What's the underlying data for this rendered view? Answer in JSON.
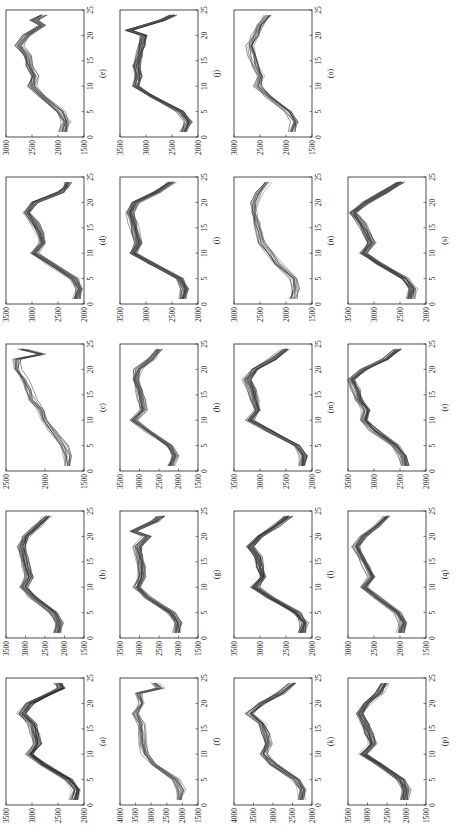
{
  "figure": {
    "layout": {
      "rows": 4,
      "cols": 5,
      "rotation_deg": -90
    },
    "x_ticks": [
      0,
      5,
      10,
      15,
      20,
      25
    ]
  },
  "chart_data": [
    {
      "type": "line",
      "label": "(a)",
      "xlim": [
        0,
        25
      ],
      "ylim": [
        2000,
        3500
      ],
      "yticks": [
        2000,
        2500,
        3000,
        3500
      ],
      "series_count": 25,
      "profile": [
        [
          1,
          2200
        ],
        [
          3,
          2150
        ],
        [
          5,
          2300
        ],
        [
          8,
          2800
        ],
        [
          10,
          3050
        ],
        [
          12,
          2900
        ],
        [
          14,
          2950
        ],
        [
          16,
          3000
        ],
        [
          18,
          3200
        ],
        [
          20,
          3050
        ],
        [
          22,
          2650
        ],
        [
          23,
          2450
        ],
        [
          24,
          2500
        ]
      ]
    },
    {
      "type": "line",
      "label": "(b)",
      "xlim": [
        0,
        25
      ],
      "ylim": [
        1500,
        3500
      ],
      "yticks": [
        1500,
        2000,
        2500,
        3000,
        3500
      ],
      "series_count": 25,
      "profile": [
        [
          1,
          2200
        ],
        [
          3,
          2150
        ],
        [
          5,
          2300
        ],
        [
          8,
          2800
        ],
        [
          10,
          3050
        ],
        [
          12,
          2900
        ],
        [
          14,
          3000
        ],
        [
          16,
          3050
        ],
        [
          18,
          3100
        ],
        [
          20,
          3000
        ],
        [
          22,
          2700
        ],
        [
          24,
          2450
        ]
      ]
    },
    {
      "type": "line",
      "label": "(c)",
      "xlim": [
        0,
        25
      ],
      "ylim": [
        1500,
        2500
      ],
      "yticks": [
        1500,
        2000,
        2500
      ],
      "series_count": 12,
      "profile": [
        [
          1,
          1700
        ],
        [
          3,
          1700
        ],
        [
          5,
          1750
        ],
        [
          8,
          1900
        ],
        [
          10,
          2000
        ],
        [
          12,
          2050
        ],
        [
          14,
          2150
        ],
        [
          16,
          2200
        ],
        [
          18,
          2250
        ],
        [
          20,
          2350
        ],
        [
          22,
          2350
        ],
        [
          23,
          2050
        ],
        [
          24,
          2300
        ]
      ]
    },
    {
      "type": "line",
      "label": "(d)",
      "xlim": [
        0,
        25
      ],
      "ylim": [
        2000,
        3500
      ],
      "yticks": [
        2000,
        2500,
        3000,
        3500
      ],
      "series_count": 25,
      "profile": [
        [
          1,
          2150
        ],
        [
          3,
          2100
        ],
        [
          5,
          2200
        ],
        [
          8,
          2650
        ],
        [
          10,
          2950
        ],
        [
          12,
          2800
        ],
        [
          14,
          2850
        ],
        [
          16,
          2950
        ],
        [
          18,
          3100
        ],
        [
          20,
          2950
        ],
        [
          22,
          2450
        ],
        [
          23,
          2350
        ],
        [
          24,
          2300
        ]
      ]
    },
    {
      "type": "line",
      "label": "(e)",
      "xlim": [
        0,
        25
      ],
      "ylim": [
        1500,
        3000
      ],
      "yticks": [
        1500,
        2000,
        2500,
        3000
      ],
      "series_count": 20,
      "profile": [
        [
          1,
          1900
        ],
        [
          3,
          1850
        ],
        [
          5,
          1950
        ],
        [
          8,
          2300
        ],
        [
          10,
          2500
        ],
        [
          12,
          2450
        ],
        [
          14,
          2550
        ],
        [
          16,
          2600
        ],
        [
          18,
          2750
        ],
        [
          20,
          2600
        ],
        [
          22,
          2300
        ],
        [
          23,
          2450
        ],
        [
          24,
          2300
        ]
      ]
    },
    {
      "type": "line",
      "label": "(f)",
      "xlim": [
        0,
        25
      ],
      "ylim": [
        1500,
        4000
      ],
      "yticks": [
        1500,
        2000,
        2500,
        3000,
        3500,
        4000
      ],
      "series_count": 15,
      "profile": [
        [
          1,
          2100
        ],
        [
          3,
          2050
        ],
        [
          5,
          2200
        ],
        [
          8,
          2900
        ],
        [
          10,
          3200
        ],
        [
          12,
          3250
        ],
        [
          14,
          3300
        ],
        [
          16,
          3350
        ],
        [
          18,
          3500
        ],
        [
          20,
          3300
        ],
        [
          22,
          3400
        ],
        [
          23,
          2700
        ],
        [
          24,
          2900
        ]
      ]
    },
    {
      "type": "line",
      "label": "(g)",
      "xlim": [
        0,
        25
      ],
      "ylim": [
        1500,
        3500
      ],
      "yticks": [
        1500,
        2000,
        2500,
        3000,
        3500
      ],
      "series_count": 25,
      "profile": [
        [
          1,
          2050
        ],
        [
          3,
          2000
        ],
        [
          5,
          2200
        ],
        [
          8,
          2800
        ],
        [
          10,
          3050
        ],
        [
          12,
          2950
        ],
        [
          14,
          2950
        ],
        [
          16,
          3000
        ],
        [
          18,
          3050
        ],
        [
          20,
          2800
        ],
        [
          21,
          3150
        ],
        [
          23,
          2600
        ],
        [
          24,
          2450
        ]
      ]
    },
    {
      "type": "line",
      "label": "(h)",
      "xlim": [
        0,
        25
      ],
      "ylim": [
        1500,
        3500
      ],
      "yticks": [
        1500,
        2000,
        2500,
        3000,
        3500
      ],
      "series_count": 25,
      "profile": [
        [
          1,
          2200
        ],
        [
          3,
          2100
        ],
        [
          5,
          2250
        ],
        [
          8,
          2800
        ],
        [
          10,
          3150
        ],
        [
          12,
          2900
        ],
        [
          14,
          2950
        ],
        [
          16,
          3000
        ],
        [
          18,
          3100
        ],
        [
          20,
          3050
        ],
        [
          22,
          2700
        ],
        [
          24,
          2500
        ]
      ]
    },
    {
      "type": "line",
      "label": "(i)",
      "xlim": [
        0,
        25
      ],
      "ylim": [
        2000,
        3500
      ],
      "yticks": [
        2000,
        2500,
        3000,
        3500
      ],
      "series_count": 30,
      "profile": [
        [
          1,
          2300
        ],
        [
          3,
          2250
        ],
        [
          5,
          2350
        ],
        [
          8,
          2900
        ],
        [
          10,
          3250
        ],
        [
          12,
          3150
        ],
        [
          14,
          3200
        ],
        [
          16,
          3250
        ],
        [
          18,
          3300
        ],
        [
          20,
          3200
        ],
        [
          22,
          2800
        ],
        [
          24,
          2500
        ]
      ]
    },
    {
      "type": "line",
      "label": "(j)",
      "xlim": [
        0,
        25
      ],
      "ylim": [
        2000,
        3500
      ],
      "yticks": [
        2000,
        2500,
        3000,
        3500
      ],
      "series_count": 25,
      "profile": [
        [
          1,
          2300
        ],
        [
          3,
          2200
        ],
        [
          5,
          2350
        ],
        [
          8,
          2900
        ],
        [
          10,
          3200
        ],
        [
          12,
          3150
        ],
        [
          14,
          3200
        ],
        [
          16,
          3150
        ],
        [
          18,
          3100
        ],
        [
          20,
          3050
        ],
        [
          21,
          3350
        ],
        [
          23,
          2700
        ],
        [
          24,
          2500
        ]
      ]
    },
    {
      "type": "line",
      "label": "(k)",
      "xlim": [
        0,
        25
      ],
      "ylim": [
        2000,
        4000
      ],
      "yticks": [
        2000,
        2500,
        3000,
        3500,
        4000
      ],
      "series_count": 20,
      "profile": [
        [
          1,
          2300
        ],
        [
          3,
          2250
        ],
        [
          5,
          2400
        ],
        [
          8,
          3000
        ],
        [
          10,
          3250
        ],
        [
          12,
          3150
        ],
        [
          14,
          3200
        ],
        [
          16,
          3300
        ],
        [
          18,
          3600
        ],
        [
          20,
          3300
        ],
        [
          22,
          2800
        ],
        [
          24,
          2500
        ]
      ]
    },
    {
      "type": "line",
      "label": "(l)",
      "xlim": [
        0,
        25
      ],
      "ylim": [
        2000,
        3500
      ],
      "yticks": [
        2000,
        2500,
        3000,
        3500
      ],
      "series_count": 25,
      "profile": [
        [
          1,
          2200
        ],
        [
          3,
          2150
        ],
        [
          5,
          2300
        ],
        [
          8,
          2800
        ],
        [
          10,
          3100
        ],
        [
          12,
          2950
        ],
        [
          14,
          3000
        ],
        [
          16,
          3050
        ],
        [
          18,
          3200
        ],
        [
          20,
          3000
        ],
        [
          22,
          2700
        ],
        [
          24,
          2450
        ]
      ]
    },
    {
      "type": "line",
      "label": "(m)",
      "xlim": [
        0,
        25
      ],
      "ylim": [
        2000,
        3500
      ],
      "yticks": [
        2000,
        2500,
        3000,
        3500
      ],
      "series_count": 25,
      "profile": [
        [
          1,
          2200
        ],
        [
          3,
          2150
        ],
        [
          5,
          2300
        ],
        [
          8,
          2850
        ],
        [
          10,
          3200
        ],
        [
          12,
          3050
        ],
        [
          14,
          3100
        ],
        [
          16,
          3150
        ],
        [
          18,
          3250
        ],
        [
          20,
          3100
        ],
        [
          22,
          2750
        ],
        [
          24,
          2500
        ]
      ]
    },
    {
      "type": "line",
      "label": "(n)",
      "xlim": [
        0,
        25
      ],
      "ylim": [
        1500,
        3000
      ],
      "yticks": [
        1500,
        2000,
        2500,
        3000
      ],
      "series_count": 12,
      "profile": [
        [
          1,
          1850
        ],
        [
          3,
          1800
        ],
        [
          5,
          1850
        ],
        [
          8,
          2150
        ],
        [
          10,
          2300
        ],
        [
          12,
          2450
        ],
        [
          14,
          2500
        ],
        [
          16,
          2550
        ],
        [
          18,
          2600
        ],
        [
          20,
          2600
        ],
        [
          22,
          2500
        ],
        [
          24,
          2350
        ]
      ]
    },
    {
      "type": "line",
      "label": "(o)",
      "xlim": [
        0,
        25
      ],
      "ylim": [
        1500,
        3000
      ],
      "yticks": [
        1500,
        2000,
        2500,
        3000
      ],
      "series_count": 15,
      "profile": [
        [
          1,
          1900
        ],
        [
          3,
          1850
        ],
        [
          5,
          1950
        ],
        [
          8,
          2350
        ],
        [
          10,
          2550
        ],
        [
          12,
          2500
        ],
        [
          14,
          2600
        ],
        [
          16,
          2650
        ],
        [
          18,
          2700
        ],
        [
          20,
          2600
        ],
        [
          22,
          2500
        ],
        [
          24,
          2350
        ]
      ]
    },
    {
      "type": "line",
      "label": "(p)",
      "xlim": [
        0,
        25
      ],
      "ylim": [
        1500,
        3500
      ],
      "yticks": [
        1500,
        2000,
        2500,
        3000,
        3500
      ],
      "series_count": 25,
      "profile": [
        [
          1,
          2050
        ],
        [
          3,
          2000
        ],
        [
          5,
          2150
        ],
        [
          8,
          2700
        ],
        [
          10,
          3100
        ],
        [
          12,
          2850
        ],
        [
          14,
          2950
        ],
        [
          16,
          3050
        ],
        [
          18,
          3200
        ],
        [
          20,
          3000
        ],
        [
          22,
          2700
        ],
        [
          24,
          2550
        ]
      ]
    },
    {
      "type": "line",
      "label": "(q)",
      "xlim": [
        0,
        25
      ],
      "ylim": [
        1500,
        3000
      ],
      "yticks": [
        1500,
        2000,
        2500,
        3000
      ],
      "series_count": 25,
      "profile": [
        [
          1,
          2000
        ],
        [
          3,
          1950
        ],
        [
          5,
          2050
        ],
        [
          8,
          2450
        ],
        [
          10,
          2700
        ],
        [
          12,
          2550
        ],
        [
          14,
          2650
        ],
        [
          16,
          2750
        ],
        [
          18,
          2850
        ],
        [
          20,
          2700
        ],
        [
          22,
          2450
        ],
        [
          24,
          2250
        ]
      ]
    },
    {
      "type": "line",
      "label": "(r)",
      "xlim": [
        0,
        25
      ],
      "ylim": [
        2000,
        3500
      ],
      "yticks": [
        2000,
        2500,
        3000,
        3500
      ],
      "series_count": 25,
      "profile": [
        [
          1,
          2400
        ],
        [
          3,
          2450
        ],
        [
          5,
          2600
        ],
        [
          8,
          3000
        ],
        [
          10,
          3200
        ],
        [
          12,
          3150
        ],
        [
          14,
          3300
        ],
        [
          16,
          3350
        ],
        [
          18,
          3450
        ],
        [
          20,
          3200
        ],
        [
          22,
          2800
        ],
        [
          24,
          2550
        ]
      ]
    },
    {
      "type": "line",
      "label": "(s)",
      "xlim": [
        0,
        25
      ],
      "ylim": [
        2000,
        3500
      ],
      "yticks": [
        2000,
        2500,
        3000,
        3500
      ],
      "series_count": 25,
      "profile": [
        [
          1,
          2300
        ],
        [
          3,
          2250
        ],
        [
          5,
          2400
        ],
        [
          8,
          2900
        ],
        [
          10,
          3200
        ],
        [
          12,
          3050
        ],
        [
          14,
          3150
        ],
        [
          16,
          3250
        ],
        [
          18,
          3400
        ],
        [
          20,
          3150
        ],
        [
          22,
          2800
        ],
        [
          24,
          2500
        ]
      ]
    }
  ]
}
